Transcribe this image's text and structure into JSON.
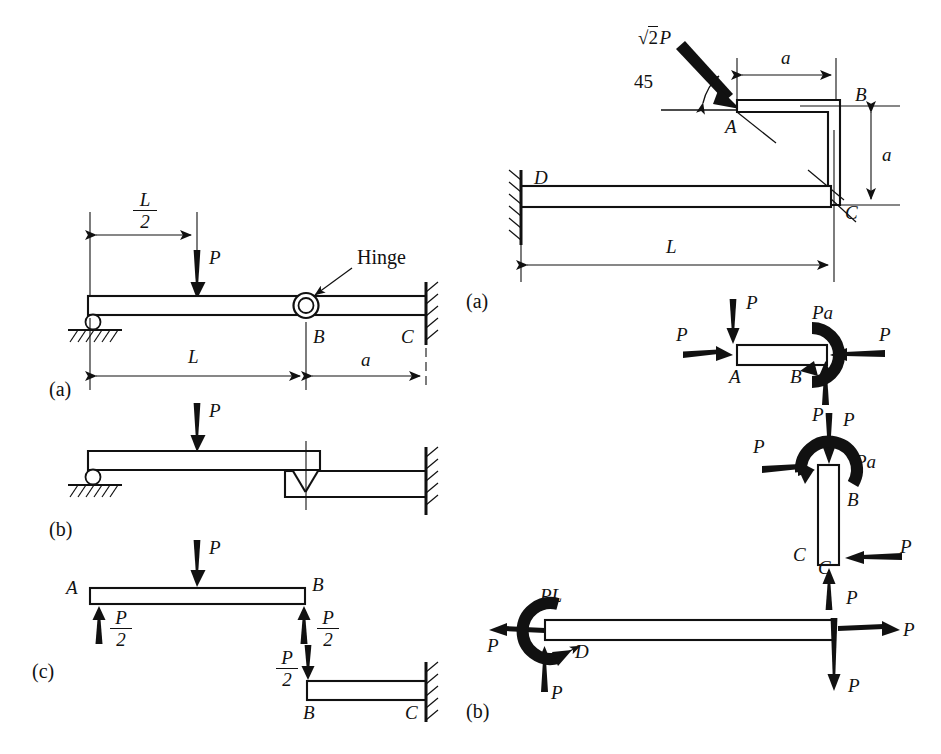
{
  "figure_left": {
    "panels": [
      "(a)",
      "(b)",
      "(c)"
    ],
    "annotations": {
      "hinge_note": "Hinge",
      "load_P": "P",
      "span_L": "L",
      "span_a": "a",
      "half_span_num": "L",
      "half_span_den": "2",
      "point_A": "A",
      "point_B": "B",
      "point_C": "C",
      "reaction_num": "P",
      "reaction_den": "2"
    }
  },
  "figure_right": {
    "panels": [
      "(a)",
      "(b)"
    ],
    "annotations": {
      "applied_load_coeff": "2",
      "applied_load_symbol": "P",
      "angle": "45",
      "dim_a_horizontal": "a",
      "dim_a_vertical": "a",
      "dim_L": "L",
      "point_A": "A",
      "point_B": "B",
      "point_C": "C",
      "point_D": "D",
      "force_P": "P",
      "moment_Pa": "Pa",
      "moment_PL": "PL"
    }
  },
  "colors": {
    "ink": "#111111",
    "paper": "#ffffff"
  }
}
